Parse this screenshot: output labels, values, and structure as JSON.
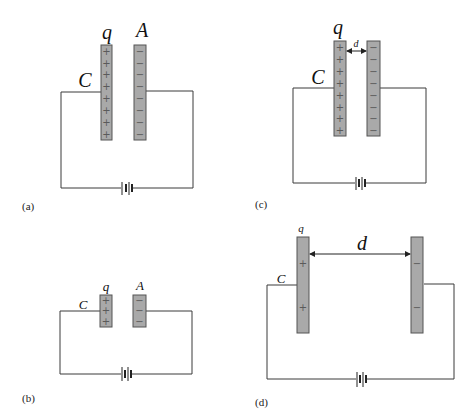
{
  "figure": {
    "colors": {
      "plate": "#a9a9a9",
      "plate_border": "#555555",
      "wire": "#3a3a3a",
      "background": "#ffffff"
    },
    "panels": [
      {
        "id": "a",
        "caption": "(a)",
        "labels": {
          "charge": "q",
          "area": "A",
          "capacitance": "C"
        },
        "positive_signs": [
          "+",
          "+",
          "+",
          "+",
          "+",
          "+",
          "+",
          "+"
        ],
        "negative_signs": [
          "−",
          "−",
          "−",
          "−",
          "−",
          "−",
          "−",
          "−"
        ]
      },
      {
        "id": "b",
        "caption": "(b)",
        "labels": {
          "charge": "q",
          "area": "A",
          "capacitance": "C"
        },
        "positive_signs": [
          "+",
          "+",
          "+"
        ],
        "negative_signs": [
          "−",
          "−",
          "−"
        ]
      },
      {
        "id": "c",
        "caption": "(c)",
        "labels": {
          "charge": "q",
          "separation": "d",
          "capacitance": "C"
        },
        "positive_signs": [
          "+",
          "+",
          "+",
          "+",
          "+",
          "+",
          "+",
          "+"
        ],
        "negative_signs": [
          "−",
          "−",
          "−",
          "−",
          "−",
          "−",
          "−",
          "−"
        ]
      },
      {
        "id": "d",
        "caption": "(d)",
        "labels": {
          "charge": "q",
          "separation": "d",
          "capacitance": "C"
        },
        "positive_signs": [
          "+",
          "+"
        ],
        "negative_signs": [
          "−",
          "−"
        ]
      }
    ]
  }
}
